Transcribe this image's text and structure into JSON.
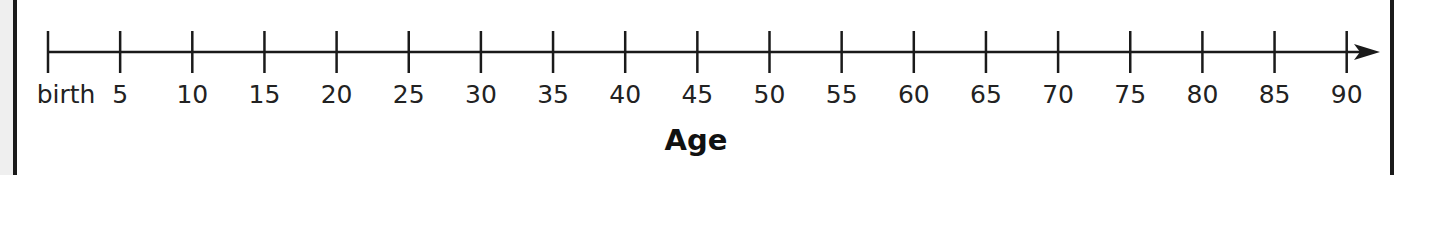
{
  "chart_data": {
    "type": "number-line",
    "title": "",
    "xlabel": "Age",
    "ticks": [
      0,
      5,
      10,
      15,
      20,
      25,
      30,
      35,
      40,
      45,
      50,
      55,
      60,
      65,
      70,
      75,
      80,
      85,
      90
    ],
    "tick_labels": [
      "birth",
      "5",
      "10",
      "15",
      "20",
      "25",
      "30",
      "35",
      "40",
      "45",
      "50",
      "55",
      "60",
      "65",
      "70",
      "75",
      "80",
      "85",
      "90"
    ],
    "xlim": [
      0,
      90
    ],
    "arrow": "right"
  },
  "axis": {
    "title": "Age"
  },
  "labels": [
    "birth",
    "5",
    "10",
    "15",
    "20",
    "25",
    "30",
    "35",
    "40",
    "45",
    "50",
    "55",
    "60",
    "65",
    "70",
    "75",
    "80",
    "85",
    "90"
  ]
}
